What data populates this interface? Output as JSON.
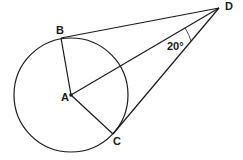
{
  "diagram": {
    "type": "geometry",
    "points": {
      "A": {
        "label": "A",
        "x": 71,
        "y": 95
      },
      "B": {
        "label": "B",
        "x": 61,
        "y": 37
      },
      "C": {
        "label": "C",
        "x": 113,
        "y": 134
      },
      "D": {
        "label": "D",
        "x": 219,
        "y": 8
      }
    },
    "circle": {
      "center": "A",
      "radius": 57
    },
    "segments": [
      "AB",
      "AC",
      "AD",
      "DB",
      "DC"
    ],
    "angle_label": "20°",
    "stroke_color": "#1a1a1a"
  }
}
